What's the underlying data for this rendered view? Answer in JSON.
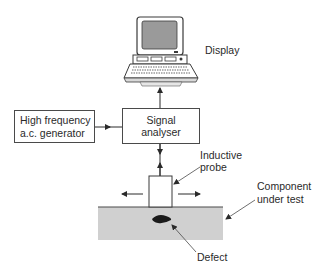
{
  "diagram": {
    "nodes": {
      "display": {
        "label": "Display",
        "icon": "desktop-computer-icon"
      },
      "generator": {
        "line1": "High frequency",
        "line2": "a.c. generator"
      },
      "analyser": {
        "line1": "Signal",
        "line2": "analyser"
      },
      "probe": {
        "line1": "Inductive",
        "line2": "probe"
      },
      "component": {
        "line1": "Component",
        "line2": "under test"
      },
      "defect": {
        "label": "Defect"
      }
    },
    "edges": [
      {
        "from": "generator",
        "to": "analyser",
        "type": "arrow"
      },
      {
        "from": "analyser",
        "to": "display",
        "type": "arrow"
      },
      {
        "from": "analyser",
        "to": "probe",
        "type": "double-arrow"
      },
      {
        "from": "probe",
        "to": "left",
        "type": "motion-arrow"
      },
      {
        "from": "probe",
        "to": "right",
        "type": "motion-arrow"
      }
    ],
    "colors": {
      "line": "#3a3a3a",
      "component_fill": "#d0d0d0",
      "defect_fill": "#1a1a1a",
      "screen_fill": "#9a9a9a"
    }
  }
}
